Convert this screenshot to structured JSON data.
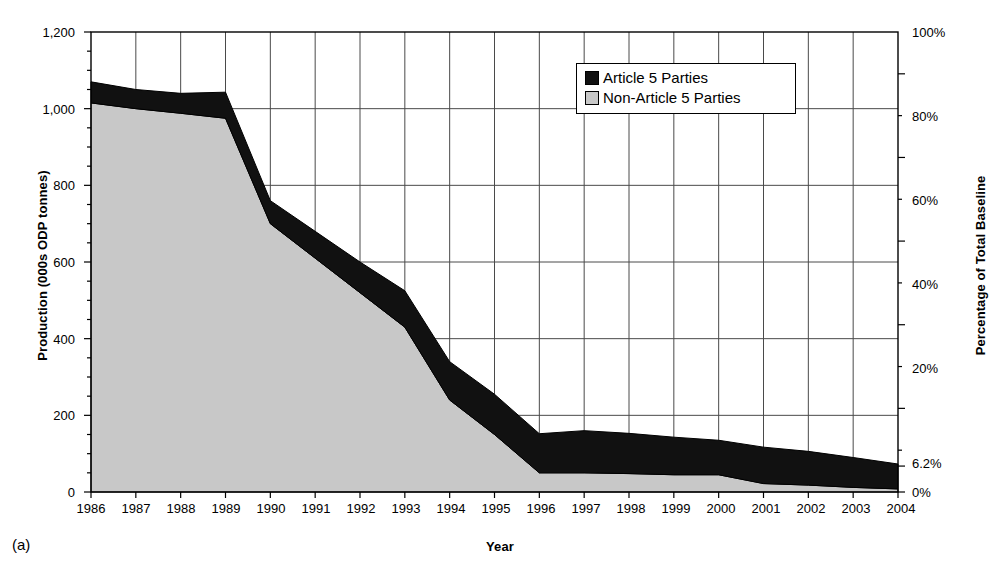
{
  "figure": {
    "panel_label": "(a)",
    "background_color": "#ffffff"
  },
  "axes": {
    "x": {
      "title": "Year",
      "ticks": [
        "1986",
        "1987",
        "1988",
        "1989",
        "1990",
        "1991",
        "1992",
        "1993",
        "1994",
        "1995",
        "1996",
        "1997",
        "1998",
        "1999",
        "2000",
        "2001",
        "2002",
        "2003",
        "2004"
      ]
    },
    "y_left": {
      "title": "Production (000s ODP tonnes)",
      "ticks": [
        "0",
        "200",
        "400",
        "600",
        "800",
        "1,000",
        "1,200"
      ],
      "min": 0,
      "max": 1200
    },
    "y_right": {
      "title": "Percentage of Total Baseline",
      "ticks": [
        "0%",
        "6.2%",
        "20%",
        "40%",
        "60%",
        "80%",
        "100%"
      ],
      "min": 0,
      "max": 110
    }
  },
  "legend": {
    "position": "inside-top-center",
    "entries": [
      {
        "label": "Article 5 Parties",
        "color": "#111111"
      },
      {
        "label": "Non-Article 5 Parties",
        "color": "#c8c8c8"
      }
    ]
  },
  "chart_data": {
    "type": "area",
    "stacked": true,
    "title": "",
    "subtitle": "",
    "xlabel": "Year",
    "ylabel": "Production (000s ODP tonnes)",
    "ylabel_secondary": "Percentage of Total Baseline",
    "xlim": [
      1986,
      2004
    ],
    "ylim": [
      0,
      1200
    ],
    "ylim_secondary": [
      0,
      110
    ],
    "grid": true,
    "legend_position": "inside-top-center",
    "x": [
      1986,
      1987,
      1988,
      1989,
      1990,
      1991,
      1992,
      1993,
      1994,
      1995,
      1996,
      1997,
      1998,
      1999,
      2000,
      2001,
      2002,
      2003,
      2004
    ],
    "series": [
      {
        "name": "Non-Article 5 Parties",
        "color": "#c8c8c8",
        "values": [
          1015,
          1000,
          988,
          975,
          700,
          610,
          520,
          430,
          240,
          150,
          50,
          50,
          48,
          45,
          45,
          22,
          18,
          12,
          8
        ]
      },
      {
        "name": "Article 5 Parties",
        "color": "#111111",
        "values": [
          55,
          50,
          52,
          68,
          60,
          70,
          80,
          95,
          100,
          105,
          102,
          110,
          105,
          98,
          90,
          95,
          88,
          78,
          65
        ]
      }
    ],
    "totals": [
      1070,
      1050,
      1040,
      1043,
      760,
      680,
      600,
      525,
      340,
      255,
      152,
      160,
      153,
      143,
      135,
      117,
      106,
      90,
      73
    ],
    "annotations": [
      {
        "text": "6.2%",
        "axis": "y_right",
        "value": 6.2
      }
    ]
  }
}
